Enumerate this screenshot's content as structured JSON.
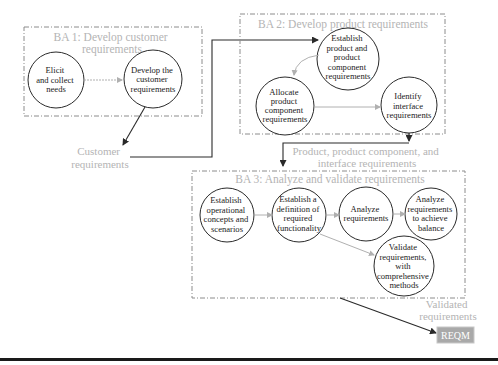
{
  "colors": {
    "title_gray": "#b4b4b4",
    "box_stroke": "#8c8c8c",
    "circle_stroke": "#2a2a2a",
    "flow_black": "#2a2a2a",
    "flow_gray": "#b0b0b0",
    "reqm_fill": "#a9a9a9",
    "footer_rule": "#1a1a1a"
  },
  "ba1": {
    "title_lines": [
      "BA 1: Develop customer",
      "requirements"
    ],
    "nodes": [
      {
        "lines": [
          "Elicit",
          "and collect",
          "needs"
        ]
      },
      {
        "lines": [
          "Develop the",
          "customer",
          "requirements"
        ]
      }
    ]
  },
  "ba2": {
    "title": "BA 2: Develop product requirements",
    "nodes": [
      {
        "lines": [
          "Establish",
          "product and",
          "product",
          "component",
          "requirements"
        ]
      },
      {
        "lines": [
          "Allocate",
          "product",
          "component",
          "requirements"
        ]
      },
      {
        "lines": [
          "Identify",
          "interface",
          "requirements"
        ]
      }
    ]
  },
  "ba3": {
    "title": "BA 3: Analyze and validate requirements",
    "nodes": [
      {
        "lines": [
          "Establish",
          "operational",
          "concepts and",
          "scenarios"
        ]
      },
      {
        "lines": [
          "Establish a",
          "definition of",
          "required",
          "functionality"
        ]
      },
      {
        "lines": [
          "Analyze",
          "requirements"
        ]
      },
      {
        "lines": [
          "Analyze",
          "requirements",
          "to achieve",
          "balance"
        ]
      },
      {
        "lines": [
          "Validate",
          "requirements,",
          "with",
          "comprehensive",
          "methods"
        ]
      }
    ]
  },
  "flows": {
    "customer_requirements": [
      "Customer",
      "requirements"
    ],
    "product_requirements": [
      "Product, product component, and",
      "interface requirements"
    ],
    "validated_requirements": [
      "Validated",
      "requirements"
    ]
  },
  "target": {
    "label": "REQM"
  }
}
